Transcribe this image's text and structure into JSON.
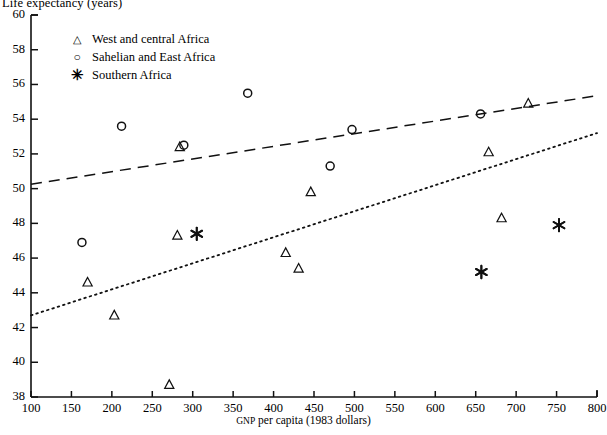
{
  "chart_data": {
    "type": "scatter",
    "title": "",
    "xlabel": "GNP per capita (1983 dollars)",
    "ylabel": "Life expectancy (years)",
    "xlim": [
      100,
      800
    ],
    "ylim": [
      38,
      60
    ],
    "xticks": [
      100,
      150,
      200,
      250,
      300,
      350,
      400,
      450,
      500,
      550,
      600,
      650,
      700,
      750,
      800
    ],
    "yticks": [
      38,
      40,
      42,
      44,
      46,
      48,
      50,
      52,
      54,
      56,
      58,
      60
    ],
    "grid": false,
    "legend_position": "upper-left",
    "series": [
      {
        "name": "West and central Africa",
        "marker": "triangle",
        "points": [
          {
            "x": 170,
            "y": 44.6
          },
          {
            "x": 203,
            "y": 42.7
          },
          {
            "x": 271,
            "y": 38.7
          },
          {
            "x": 281,
            "y": 47.3
          },
          {
            "x": 284,
            "y": 52.4
          },
          {
            "x": 415,
            "y": 46.3
          },
          {
            "x": 431,
            "y": 45.4
          },
          {
            "x": 446,
            "y": 49.8
          },
          {
            "x": 682,
            "y": 48.3
          },
          {
            "x": 666,
            "y": 52.1
          },
          {
            "x": 715,
            "y": 54.9
          }
        ]
      },
      {
        "name": "Sahelian and East Africa",
        "marker": "circle",
        "points": [
          {
            "x": 163,
            "y": 46.9
          },
          {
            "x": 212,
            "y": 53.6
          },
          {
            "x": 289,
            "y": 52.5
          },
          {
            "x": 368,
            "y": 55.5
          },
          {
            "x": 470,
            "y": 51.3
          },
          {
            "x": 497,
            "y": 53.4
          },
          {
            "x": 656,
            "y": 54.3
          }
        ]
      },
      {
        "name": "Southern Africa",
        "marker": "star",
        "points": [
          {
            "x": 305,
            "y": 47.4
          },
          {
            "x": 657,
            "y": 45.2
          },
          {
            "x": 753,
            "y": 47.9
          }
        ]
      }
    ],
    "trend_lines": [
      {
        "name": "upper-dashed-trend",
        "style": "dashed",
        "x0": 100,
        "y0": 50.25,
        "x1": 800,
        "y1": 55.35
      },
      {
        "name": "lower-dotted-trend",
        "style": "dotted",
        "x0": 100,
        "y0": 42.7,
        "x1": 800,
        "y1": 53.2
      }
    ]
  },
  "legend": {
    "items": [
      {
        "symbol": "triangle-marker",
        "glyph": "△",
        "label": "West and central Africa"
      },
      {
        "symbol": "circle-marker",
        "glyph": "○",
        "label": "Sahelian and East Africa"
      },
      {
        "symbol": "star-marker",
        "glyph": "✳",
        "label": "Southern Africa"
      }
    ]
  },
  "axes": {
    "y_axis_title": "Life expectancy (years)",
    "x_axis_title_main": "per capita (1983 dollars)",
    "x_axis_title_prefix": "GNP"
  }
}
